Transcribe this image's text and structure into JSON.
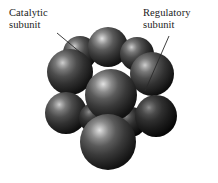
{
  "figure": {
    "background_color": "#ffffff",
    "width": 218,
    "height": 183
  },
  "labels": {
    "catalytic": {
      "text": "Catalytic\nsubunit",
      "line1": "Catalytic",
      "line2": "subunit",
      "x": 9,
      "y": 7,
      "leader_from": [
        57,
        33
      ],
      "leader_to": [
        81,
        53
      ]
    },
    "regulatory": {
      "text": "Regulatory\nsubunit",
      "line1": "Regulatory",
      "line2": "subunit",
      "x": 143,
      "y": 7,
      "leader_from": [
        169,
        36
      ],
      "leader_to": [
        145,
        91
      ]
    }
  },
  "leader_line": {
    "color": "#2a2a2a",
    "width": 0.9
  },
  "model": {
    "sphere_base_color": "#3b3b3b",
    "sphere_dark_color": "#141414",
    "sphere_highlight_color": "#c9c9c9",
    "spheres": [
      {
        "name": "top-back-left",
        "cx": 80,
        "cy": 53,
        "r": 17,
        "shade": "mid",
        "hx": -0.35,
        "hy": -0.45
      },
      {
        "name": "top-back-center",
        "cx": 108,
        "cy": 47,
        "r": 20,
        "shade": "light",
        "hx": -0.3,
        "hy": -0.48
      },
      {
        "name": "top-back-right",
        "cx": 137,
        "cy": 54,
        "r": 17,
        "shade": "mid",
        "hx": -0.3,
        "hy": -0.45
      },
      {
        "name": "upper-left",
        "cx": 70,
        "cy": 72,
        "r": 23,
        "shade": "mid",
        "hx": -0.32,
        "hy": -0.4
      },
      {
        "name": "upper-right",
        "cx": 152,
        "cy": 74,
        "r": 22,
        "shade": "mid",
        "hx": -0.3,
        "hy": -0.4
      },
      {
        "name": "center-front-top",
        "cx": 111,
        "cy": 95,
        "r": 26,
        "shade": "light",
        "hx": -0.3,
        "hy": -0.42
      },
      {
        "name": "lower-left",
        "cx": 66,
        "cy": 113,
        "r": 21,
        "shade": "mid",
        "hx": -0.32,
        "hy": -0.4
      },
      {
        "name": "lower-mid-left",
        "cx": 94,
        "cy": 118,
        "r": 15,
        "shade": "dark",
        "hx": -0.3,
        "hy": -0.42
      },
      {
        "name": "lower-right",
        "cx": 156,
        "cy": 116,
        "r": 21,
        "shade": "dark",
        "hx": -0.28,
        "hy": -0.38
      },
      {
        "name": "lower-mid-right",
        "cx": 131,
        "cy": 122,
        "r": 15,
        "shade": "dark",
        "hx": -0.3,
        "hy": -0.42
      },
      {
        "name": "bottom-front",
        "cx": 108,
        "cy": 142,
        "r": 28,
        "shade": "light",
        "hx": -0.32,
        "hy": -0.44
      }
    ]
  }
}
